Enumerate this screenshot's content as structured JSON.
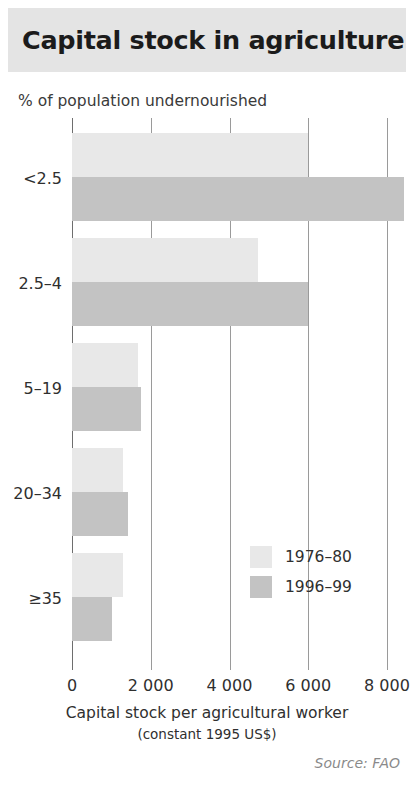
{
  "header": {
    "title": "Capital stock in agriculture",
    "band_color": "#e4e4e4"
  },
  "source": {
    "text": "Source: FAO"
  },
  "chart_data": {
    "type": "bar",
    "orientation": "horizontal",
    "title": "Capital stock in agriculture",
    "ylabel": "% of population undernourished",
    "xlabel": "Capital stock per agricultural worker",
    "xlabel_sub": "(constant 1995 US$)",
    "categories": [
      "<2.5",
      "2.5–4",
      "5–19",
      "20–34",
      "≥35"
    ],
    "series": [
      {
        "name": "1976–80",
        "color": "#e8e8e8",
        "values": [
          6000,
          4730,
          1680,
          1300,
          1300
        ]
      },
      {
        "name": "1996–99",
        "color": "#c3c3c3",
        "values": [
          8430,
          6000,
          1755,
          1425,
          1020
        ]
      }
    ],
    "xticks": [
      0,
      2000,
      4000,
      6000,
      8000
    ],
    "xticklabels": [
      "0",
      "2 000",
      "4 000",
      "6 000",
      "8 000"
    ],
    "xlim": [
      0,
      8000
    ],
    "grid": true,
    "grid_axis": "x",
    "legend_position": "center"
  }
}
